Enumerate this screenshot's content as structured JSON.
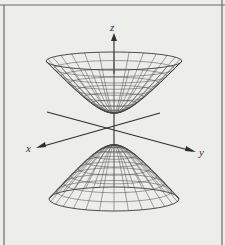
{
  "figure": {
    "axes": {
      "x_label": "x",
      "y_label": "y",
      "z_label": "z"
    },
    "surface": {
      "type": "hyperboloid-of-two-sheets",
      "upper_sheet": "opens upward",
      "lower_sheet": "opens downward"
    },
    "colors": {
      "background": "#ededeb",
      "lines": "#333333",
      "frame": "#6a6a6a"
    }
  }
}
